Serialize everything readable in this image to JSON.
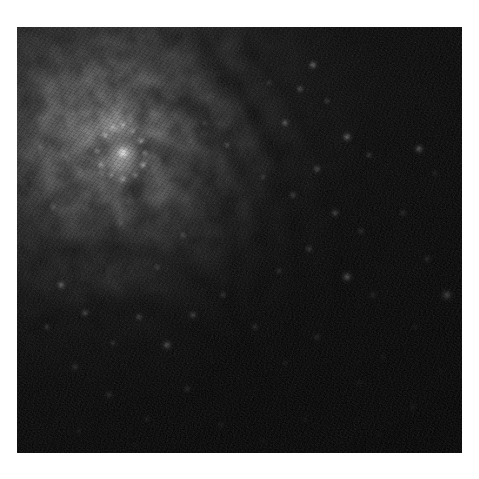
{
  "page": {
    "background_color": "#ffffff",
    "width": 479,
    "height": 479
  },
  "photo": {
    "name": "galaxy-photograph",
    "alt_text": "Monochrome telescope image of a spiral galaxy core with dust lanes",
    "frame": {
      "left": 17,
      "top": 27,
      "width": 445,
      "height": 426
    },
    "palette": {
      "background_black": "#050505",
      "deep_shadow": "#0a0a0a",
      "dust_dark": "#1a1a1a",
      "disk_mid": "#3a3a3a",
      "bulge_glow": "#8c8c8c",
      "core_bright": "#d8d8d8",
      "nucleus_white": "#f2f2f2",
      "star_white": "#ffffff"
    },
    "subject": "spiral galaxy",
    "features": [
      {
        "id": "nucleus",
        "label": "bright galactic nucleus",
        "cx_pct": 21.5,
        "cy_pct": 27.0
      },
      {
        "id": "circumnuclear-ring",
        "label": "circumnuclear star-forming ring",
        "cx_pct": 21.0,
        "cy_pct": 26.5
      },
      {
        "id": "bulge",
        "label": "central bulge glow",
        "cx_pct": 21.0,
        "cy_pct": 27.0
      },
      {
        "id": "inner-dust-lane",
        "label": "inner dust lane",
        "cx_pct": 33.0,
        "cy_pct": 38.0
      },
      {
        "id": "spiral-arm-east",
        "label": "eastern spiral arm",
        "cx_pct": 58.0,
        "cy_pct": 30.0
      },
      {
        "id": "spiral-arm-south",
        "label": "southern spiral arm",
        "cx_pct": 30.0,
        "cy_pct": 68.0
      },
      {
        "id": "outer-halo",
        "label": "dark outer halo",
        "cx_pct": 82.0,
        "cy_pct": 72.0
      }
    ],
    "glow_nodes": [
      {
        "cx": 21.5,
        "cy": 27.0,
        "r": 30.0,
        "i": 0.96
      },
      {
        "cx": 21.0,
        "cy": 27.0,
        "r": 15.0,
        "i": 1.0
      },
      {
        "cx": 22.0,
        "cy": 28.0,
        "r": 6.5,
        "i": 1.0
      },
      {
        "cx": 24.0,
        "cy": 23.0,
        "r": 44.0,
        "i": 0.62
      },
      {
        "cx": 28.0,
        "cy": 34.0,
        "r": 60.0,
        "i": 0.4
      },
      {
        "cx": 34.0,
        "cy": 45.0,
        "r": 70.0,
        "i": 0.24
      }
    ],
    "dust_lanes": [
      {
        "d": "M 188 24 C 250 86 286 168 282 262 C 278 340 238 396 176 426",
        "w": 15,
        "o": 0.55
      },
      {
        "d": "M 232 18 C 300 96 330 186 320 272 C 312 348 272 404 214 430",
        "w": 12,
        "o": 0.46
      },
      {
        "d": "M 120 66 C 180 72 230 124 244 196 C 258 268 228 336 160 378",
        "w": 10,
        "o": 0.5
      },
      {
        "d": "M 60 132 C 96 110 144 112 178 142 C 214 174 226 226 214 276",
        "w": 8,
        "o": 0.52
      },
      {
        "d": "M 18 232 C 70 210 134 216 182 252 C 226 286 246 336 244 388",
        "w": 11,
        "o": 0.48
      },
      {
        "d": "M 14 300 C 82 272 160 280 220 326 C 268 362 292 404 298 440",
        "w": 13,
        "o": 0.42
      },
      {
        "d": "M 92 108 C 112 124 118 150 112 174",
        "w": 4,
        "o": 0.6
      },
      {
        "d": "M 70 150 C 86 176 96 206 94 232",
        "w": 4,
        "o": 0.5
      }
    ],
    "arm_ridges": [
      {
        "d": "M 200 10 C 268 78 310 172 304 268 C 298 356 252 418 186 444",
        "w": 26,
        "o": 0.3
      },
      {
        "d": "M 150 40 C 214 66 260 130 268 204 C 278 288 242 356 174 398",
        "w": 22,
        "o": 0.26
      },
      {
        "d": "M 24 250 C 96 224 176 238 234 294 C 282 340 304 396 306 446",
        "w": 24,
        "o": 0.22
      },
      {
        "d": "M 40 60 C 120 46 198 92 236 170",
        "w": 18,
        "o": 0.18
      }
    ],
    "star_clusters": [
      {
        "x": 296,
        "y": 38,
        "r": 1.6,
        "i": 0.72
      },
      {
        "x": 283,
        "y": 62,
        "r": 1.3,
        "i": 0.6
      },
      {
        "x": 310,
        "y": 74,
        "r": 1.1,
        "i": 0.52
      },
      {
        "x": 268,
        "y": 96,
        "r": 1.4,
        "i": 0.66
      },
      {
        "x": 330,
        "y": 110,
        "r": 1.8,
        "i": 0.78
      },
      {
        "x": 352,
        "y": 128,
        "r": 1.2,
        "i": 0.55
      },
      {
        "x": 300,
        "y": 142,
        "r": 1.5,
        "i": 0.62
      },
      {
        "x": 276,
        "y": 168,
        "r": 1.3,
        "i": 0.58
      },
      {
        "x": 246,
        "y": 150,
        "r": 1.1,
        "i": 0.5
      },
      {
        "x": 318,
        "y": 186,
        "r": 1.6,
        "i": 0.68
      },
      {
        "x": 344,
        "y": 204,
        "r": 1.2,
        "i": 0.54
      },
      {
        "x": 292,
        "y": 222,
        "r": 1.4,
        "i": 0.6
      },
      {
        "x": 262,
        "y": 244,
        "r": 1.2,
        "i": 0.52
      },
      {
        "x": 330,
        "y": 250,
        "r": 2.2,
        "i": 0.85
      },
      {
        "x": 356,
        "y": 268,
        "r": 1.3,
        "i": 0.56
      },
      {
        "x": 402,
        "y": 122,
        "r": 1.9,
        "i": 0.74
      },
      {
        "x": 418,
        "y": 146,
        "r": 1.1,
        "i": 0.46
      },
      {
        "x": 386,
        "y": 186,
        "r": 1.3,
        "i": 0.52
      },
      {
        "x": 410,
        "y": 232,
        "r": 1.4,
        "i": 0.58
      },
      {
        "x": 430,
        "y": 268,
        "r": 2.6,
        "i": 0.9
      },
      {
        "x": 398,
        "y": 300,
        "r": 1.2,
        "i": 0.48
      },
      {
        "x": 424,
        "y": 344,
        "r": 1.1,
        "i": 0.44
      },
      {
        "x": 396,
        "y": 380,
        "r": 1.6,
        "i": 0.62
      },
      {
        "x": 366,
        "y": 330,
        "r": 1.2,
        "i": 0.48
      },
      {
        "x": 342,
        "y": 356,
        "r": 1.3,
        "i": 0.52
      },
      {
        "x": 300,
        "y": 310,
        "r": 1.5,
        "i": 0.58
      },
      {
        "x": 268,
        "y": 336,
        "r": 1.2,
        "i": 0.5
      },
      {
        "x": 238,
        "y": 300,
        "r": 1.4,
        "i": 0.56
      },
      {
        "x": 206,
        "y": 268,
        "r": 1.3,
        "i": 0.54
      },
      {
        "x": 176,
        "y": 288,
        "r": 1.6,
        "i": 0.64
      },
      {
        "x": 150,
        "y": 318,
        "r": 2.0,
        "i": 0.78
      },
      {
        "x": 122,
        "y": 290,
        "r": 1.4,
        "i": 0.58
      },
      {
        "x": 96,
        "y": 316,
        "r": 1.2,
        "i": 0.5
      },
      {
        "x": 68,
        "y": 286,
        "r": 1.5,
        "i": 0.6
      },
      {
        "x": 44,
        "y": 258,
        "r": 1.7,
        "i": 0.66
      },
      {
        "x": 30,
        "y": 300,
        "r": 1.2,
        "i": 0.48
      },
      {
        "x": 58,
        "y": 340,
        "r": 1.3,
        "i": 0.52
      },
      {
        "x": 92,
        "y": 368,
        "r": 1.4,
        "i": 0.56
      },
      {
        "x": 130,
        "y": 392,
        "r": 1.2,
        "i": 0.46
      },
      {
        "x": 170,
        "y": 362,
        "r": 1.5,
        "i": 0.58
      },
      {
        "x": 204,
        "y": 398,
        "r": 1.3,
        "i": 0.5
      },
      {
        "x": 246,
        "y": 414,
        "r": 1.1,
        "i": 0.42
      },
      {
        "x": 288,
        "y": 392,
        "r": 1.2,
        "i": 0.46
      },
      {
        "x": 118,
        "y": 418,
        "r": 1.0,
        "i": 0.38
      },
      {
        "x": 62,
        "y": 404,
        "r": 1.1,
        "i": 0.4
      },
      {
        "x": 210,
        "y": 118,
        "r": 1.2,
        "i": 0.5
      },
      {
        "x": 188,
        "y": 96,
        "r": 1.0,
        "i": 0.42
      },
      {
        "x": 166,
        "y": 208,
        "r": 1.3,
        "i": 0.52
      },
      {
        "x": 140,
        "y": 240,
        "r": 1.1,
        "i": 0.44
      },
      {
        "x": 104,
        "y": 196,
        "r": 1.0,
        "i": 0.4
      },
      {
        "x": 36,
        "y": 180,
        "r": 1.2,
        "i": 0.46
      },
      {
        "x": 24,
        "y": 120,
        "r": 1.0,
        "i": 0.38
      },
      {
        "x": 252,
        "y": 56,
        "r": 1.0,
        "i": 0.4
      },
      {
        "x": 362,
        "y": 408,
        "r": 1.2,
        "i": 0.44
      },
      {
        "x": 432,
        "y": 412,
        "r": 1.0,
        "i": 0.36
      }
    ],
    "nucleus_ring_knots": [
      {
        "x": 88,
        "y": 108,
        "r": 1.9,
        "i": 0.95
      },
      {
        "x": 96,
        "y": 100,
        "r": 1.5,
        "i": 0.88
      },
      {
        "x": 106,
        "y": 98,
        "r": 1.7,
        "i": 0.92
      },
      {
        "x": 116,
        "y": 104,
        "r": 1.5,
        "i": 0.86
      },
      {
        "x": 124,
        "y": 114,
        "r": 1.8,
        "i": 0.94
      },
      {
        "x": 128,
        "y": 126,
        "r": 1.6,
        "i": 0.9
      },
      {
        "x": 126,
        "y": 138,
        "r": 1.9,
        "i": 0.96
      },
      {
        "x": 118,
        "y": 148,
        "r": 1.6,
        "i": 0.88
      },
      {
        "x": 106,
        "y": 152,
        "r": 1.8,
        "i": 0.92
      },
      {
        "x": 94,
        "y": 148,
        "r": 1.5,
        "i": 0.84
      },
      {
        "x": 84,
        "y": 138,
        "r": 1.7,
        "i": 0.9
      },
      {
        "x": 80,
        "y": 124,
        "r": 1.6,
        "i": 0.86
      }
    ]
  }
}
